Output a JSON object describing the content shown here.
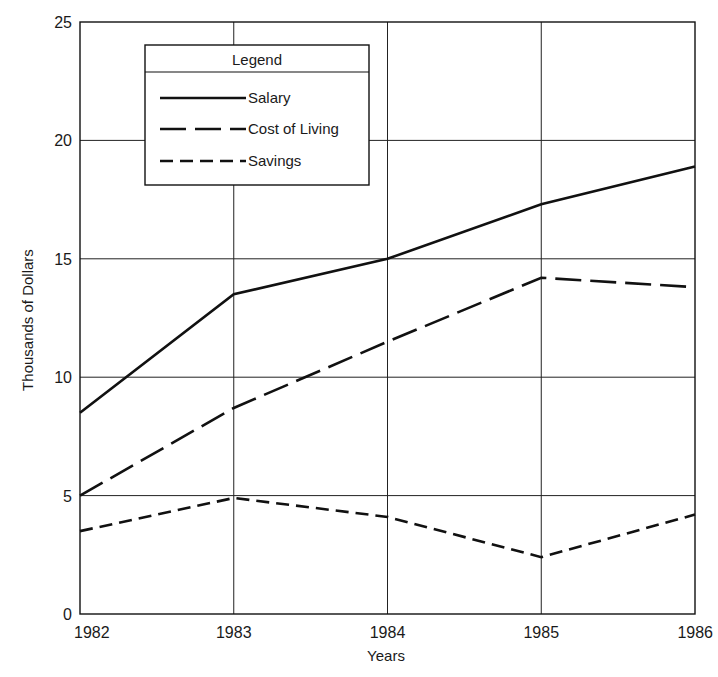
{
  "chart_data": {
    "type": "line",
    "title": "",
    "xlabel": "Years",
    "ylabel": "Thousands of Dollars",
    "categories": [
      "1982",
      "1983",
      "1984",
      "1985",
      "1986"
    ],
    "x": [
      1982,
      1983,
      1984,
      1985,
      1986
    ],
    "yticks": [
      0,
      5,
      10,
      15,
      20,
      25
    ],
    "ylim": [
      0,
      25
    ],
    "grid": true,
    "legend_title": "Legend",
    "legend_position": "upper-left inside",
    "series": [
      {
        "name": "Salary",
        "style": "solid",
        "values": [
          8.5,
          13.5,
          15.0,
          17.3,
          18.9
        ]
      },
      {
        "name": "Cost of Living",
        "style": "long-dash",
        "values": [
          5.0,
          8.7,
          11.5,
          14.2,
          13.8
        ]
      },
      {
        "name": "Savings",
        "style": "short-dash",
        "values": [
          3.5,
          4.9,
          4.1,
          2.4,
          4.2
        ]
      }
    ]
  },
  "colors": {
    "line": "#111111",
    "grid": "#222222",
    "background": "#ffffff"
  }
}
